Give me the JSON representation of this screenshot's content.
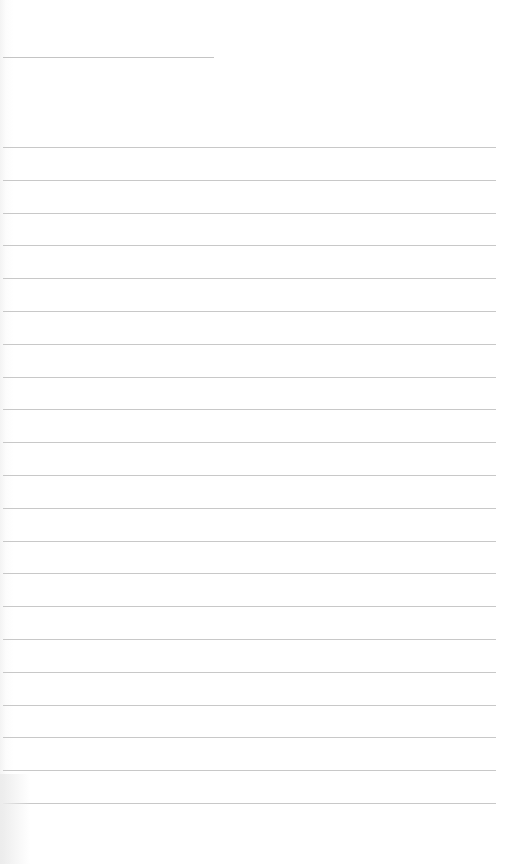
{
  "page": {
    "type": "lined-notepad",
    "background": "#ffffff",
    "line_color": "#c8c8c8",
    "title_line": {
      "top": 57,
      "left": 3,
      "width": 211
    },
    "rules": {
      "first_top": 147,
      "spacing": 32.8,
      "count": 21,
      "left": 3,
      "width": 493
    }
  }
}
